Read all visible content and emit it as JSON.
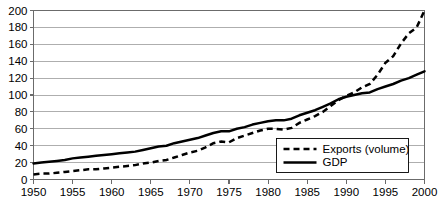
{
  "chart_data": {
    "type": "line",
    "title": "",
    "subtitle": "",
    "xlabel": "",
    "ylabel": "",
    "xlim": [
      1950,
      2000
    ],
    "ylim": [
      0,
      200
    ],
    "ytick_step": 20,
    "xtick_step": 5,
    "grid": "horizontal",
    "legend_position": "bottom-right",
    "yticks": [
      "0",
      "20",
      "40",
      "60",
      "80",
      "100",
      "120",
      "140",
      "160",
      "180",
      "200"
    ],
    "ytick_values": [
      0,
      20,
      40,
      60,
      80,
      100,
      120,
      140,
      160,
      180,
      200
    ],
    "xticks": [
      "1950",
      "1955",
      "1960",
      "1965",
      "1970",
      "1975",
      "1980",
      "1985",
      "1990",
      "1995",
      "2000"
    ],
    "xtick_values": [
      1950,
      1955,
      1960,
      1965,
      1970,
      1975,
      1980,
      1985,
      1990,
      1995,
      2000
    ],
    "x": [
      1950,
      1951,
      1952,
      1953,
      1954,
      1955,
      1956,
      1957,
      1958,
      1959,
      1960,
      1961,
      1962,
      1963,
      1964,
      1965,
      1966,
      1967,
      1968,
      1969,
      1970,
      1971,
      1972,
      1973,
      1974,
      1975,
      1976,
      1977,
      1978,
      1979,
      1980,
      1981,
      1982,
      1983,
      1984,
      1985,
      1986,
      1987,
      1988,
      1989,
      1990,
      1991,
      1992,
      1993,
      1994,
      1995,
      1996,
      1997,
      1998,
      1999,
      2000
    ],
    "series": [
      {
        "name": "Exports (volume)",
        "style": "dashed",
        "color": "#000000",
        "values": [
          6,
          7,
          7,
          8,
          9,
          10,
          11,
          12,
          12,
          13,
          14,
          15,
          16,
          17,
          19,
          20,
          22,
          23,
          26,
          29,
          32,
          34,
          38,
          43,
          45,
          44,
          49,
          52,
          55,
          58,
          60,
          60,
          59,
          61,
          67,
          71,
          75,
          80,
          87,
          94,
          99,
          103,
          109,
          113,
          124,
          138,
          146,
          161,
          173,
          180,
          200
        ]
      },
      {
        "name": "GDP",
        "style": "solid",
        "color": "#000000",
        "values": [
          19,
          20,
          21,
          22,
          23,
          25,
          26,
          27,
          28,
          29,
          30,
          31,
          32,
          33,
          35,
          37,
          39,
          40,
          43,
          45,
          47,
          49,
          52,
          55,
          57,
          57,
          60,
          62,
          65,
          67,
          69,
          70,
          70,
          72,
          76,
          79,
          82,
          86,
          90,
          95,
          98,
          100,
          102,
          103,
          107,
          110,
          113,
          117,
          120,
          124,
          128
        ]
      }
    ]
  },
  "legend": {
    "items": [
      {
        "label": "Exports (volume)",
        "style": "dashed"
      },
      {
        "label": "GDP",
        "style": "solid"
      }
    ]
  }
}
